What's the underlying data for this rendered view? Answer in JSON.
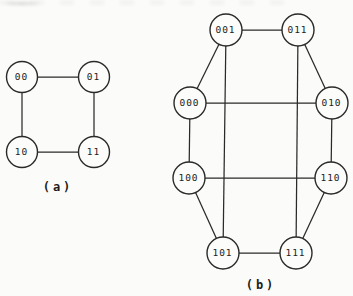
{
  "figure": {
    "background": "#fbfbf9",
    "ink_color": "#2a2a28",
    "node_fill": "#fcfcfa",
    "edge_width": 1.25,
    "circle_stroke_width": 1.4,
    "node_font_size": 9.5,
    "caption_font_size": 12
  },
  "diagrams": [
    {
      "id": "a",
      "caption": "(a)",
      "caption_x": 58,
      "caption_y": 187,
      "node_radius": 15.5,
      "nodes": [
        {
          "id": "00",
          "label": "00",
          "x": 22,
          "y": 77
        },
        {
          "id": "01",
          "label": "01",
          "x": 94,
          "y": 77
        },
        {
          "id": "10",
          "label": "10",
          "x": 22,
          "y": 152
        },
        {
          "id": "11",
          "label": "11",
          "x": 94,
          "y": 152
        }
      ],
      "edges": [
        [
          "00",
          "01"
        ],
        [
          "00",
          "10"
        ],
        [
          "01",
          "11"
        ],
        [
          "10",
          "11"
        ]
      ]
    },
    {
      "id": "b",
      "caption": "(b)",
      "caption_x": 261,
      "caption_y": 285,
      "node_radius": 16,
      "nodes": [
        {
          "id": "001",
          "label": "001",
          "x": 226,
          "y": 30
        },
        {
          "id": "011",
          "label": "011",
          "x": 298,
          "y": 30
        },
        {
          "id": "000",
          "label": "000",
          "x": 190,
          "y": 103
        },
        {
          "id": "010",
          "label": "010",
          "x": 332,
          "y": 103
        },
        {
          "id": "100",
          "label": "100",
          "x": 189,
          "y": 178
        },
        {
          "id": "110",
          "label": "110",
          "x": 331,
          "y": 178
        },
        {
          "id": "101",
          "label": "101",
          "x": 223,
          "y": 253
        },
        {
          "id": "111",
          "label": "111",
          "x": 296,
          "y": 253
        }
      ],
      "edges": [
        [
          "001",
          "011"
        ],
        [
          "001",
          "000"
        ],
        [
          "011",
          "010"
        ],
        [
          "001",
          "101"
        ],
        [
          "011",
          "111"
        ],
        [
          "000",
          "010"
        ],
        [
          "000",
          "100"
        ],
        [
          "010",
          "110"
        ],
        [
          "100",
          "110"
        ],
        [
          "100",
          "101"
        ],
        [
          "110",
          "111"
        ],
        [
          "101",
          "111"
        ]
      ]
    }
  ]
}
